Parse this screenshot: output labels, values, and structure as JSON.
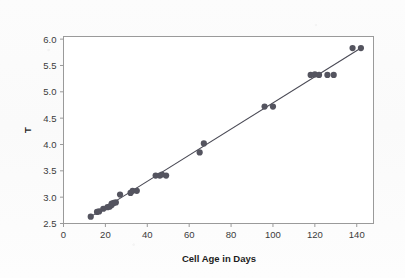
{
  "figure": {
    "width": 405,
    "height": 278,
    "background_color": "#fdfdfd",
    "plot_background_color": "#ffffff",
    "frame_color": "#9a9a9a"
  },
  "chart_data": {
    "type": "scatter",
    "title": "",
    "subtitle": "",
    "xlabel": "Cell Age in Days",
    "ylabel": "T",
    "xlim": [
      0,
      148
    ],
    "ylim": [
      2.5,
      6.05
    ],
    "xticks": [
      0,
      20,
      40,
      60,
      80,
      100,
      120,
      140
    ],
    "xtick_labels": [
      "0",
      "20",
      "40",
      "60",
      "80",
      "100",
      "120",
      "140"
    ],
    "yticks": [
      2.5,
      3.0,
      3.5,
      4.0,
      4.5,
      5.0,
      5.5,
      6.0
    ],
    "ytick_labels": [
      "2.5",
      "3.0",
      "3.5",
      "4.0",
      "4.5",
      "5.0",
      "5.5",
      "6.0"
    ],
    "grid": false,
    "legend": false,
    "legend_position": "none",
    "marker_color": "#54545f",
    "marker_size": 3.1,
    "line_color": "#4a4a55",
    "series": [
      {
        "name": "observations",
        "x": [
          13,
          16,
          17,
          19,
          21,
          22,
          23,
          23,
          24,
          25,
          27,
          32,
          33,
          35,
          44,
          46,
          47,
          49,
          65,
          67,
          96,
          100,
          118,
          120,
          122,
          126,
          129,
          138,
          142
        ],
        "y": [
          2.63,
          2.72,
          2.73,
          2.78,
          2.81,
          2.82,
          2.85,
          2.88,
          2.89,
          2.9,
          3.05,
          3.08,
          3.12,
          3.12,
          3.41,
          3.41,
          3.43,
          3.41,
          3.85,
          4.02,
          4.72,
          4.72,
          5.32,
          5.33,
          5.32,
          5.32,
          5.32,
          5.83,
          5.83
        ]
      }
    ],
    "fit_line": {
      "name": "fitted-regression-line",
      "x": [
        13,
        142
      ],
      "y": [
        2.63,
        5.83
      ]
    }
  }
}
